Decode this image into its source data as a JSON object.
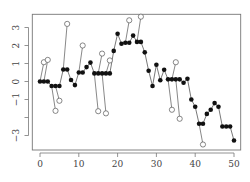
{
  "chart_data": {
    "type": "line",
    "title": "",
    "xlabel": "",
    "ylabel": "",
    "xlim": [
      -2,
      52
    ],
    "ylim": [
      -3.6,
      3.8
    ],
    "grid": false,
    "legend": null,
    "x_ticks": [
      0,
      10,
      20,
      30,
      40,
      50
    ],
    "y_ticks": [
      -3,
      -2,
      -1,
      0,
      1,
      2,
      3
    ],
    "y_tick_labels": [
      "−3",
      "",
      "−1",
      "0",
      "1",
      "2",
      "3"
    ],
    "x_tick_labels": [
      "0",
      "10",
      "20",
      "30",
      "40",
      "50"
    ],
    "series": [
      {
        "name": "filtered",
        "marker": "filled-circle",
        "x": [
          0,
          1,
          2,
          3,
          4,
          5,
          6,
          7,
          8,
          9,
          10,
          11,
          12,
          13,
          14,
          15,
          16,
          17,
          18,
          19,
          20,
          21,
          22,
          23,
          24,
          25,
          26,
          27,
          28,
          29,
          30,
          31,
          32,
          33,
          34,
          35,
          36,
          37,
          38,
          39,
          40,
          41,
          42,
          43,
          44,
          45,
          46,
          47,
          48,
          49,
          50
        ],
        "values": [
          0,
          0,
          0,
          -0.25,
          -0.25,
          -0.25,
          0.67,
          0.67,
          0.08,
          -0.2,
          0.5,
          0.5,
          0.8,
          1.05,
          0.45,
          0.45,
          0.45,
          0.45,
          0.45,
          1.7,
          2.65,
          2.1,
          2.15,
          2.15,
          2.55,
          2.2,
          2.2,
          1.62,
          0.6,
          -0.25,
          0.93,
          0.07,
          0.65,
          0.12,
          0.12,
          0.12,
          0.12,
          -0.07,
          0.15,
          -1.0,
          -1.4,
          -2.35,
          -2.35,
          -1.8,
          -1.57,
          -1.2,
          -1.4,
          -2.5,
          -2.5,
          -2.5,
          -3.28
        ]
      },
      {
        "name": "outliers",
        "marker": "open-circle",
        "x": [
          1,
          2,
          4,
          5,
          7,
          11,
          15,
          16,
          17,
          18,
          23,
          26,
          34,
          35,
          36,
          42
        ],
        "values": [
          1.07,
          1.2,
          -1.63,
          -1.07,
          3.2,
          2.0,
          -1.65,
          1.55,
          -1.77,
          1.17,
          3.4,
          3.6,
          -1.57,
          1.07,
          -2.07,
          -3.5
        ]
      }
    ]
  },
  "colors": {
    "line": "#555555",
    "marker_fill": "#111111",
    "axis": "#777777",
    "background": "#ffffff"
  }
}
